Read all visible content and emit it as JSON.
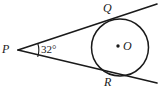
{
  "figure": {
    "type": "geometry-diagram",
    "background_color": "#ffffff",
    "stroke_color": "#1a1a1a",
    "labels": {
      "external_point": "P",
      "upper_tangent_point": "Q",
      "lower_tangent_point": "R",
      "center": "O",
      "angle": "32°"
    },
    "geometry": {
      "circle": {
        "cx": 120,
        "cy": 47.5,
        "r": 28.5
      },
      "center_dot": {
        "cx": 118,
        "cy": 46,
        "r": 1.6
      },
      "external_point": {
        "x": 18,
        "y": 50
      },
      "tangent_point_Q": {
        "x": 112,
        "y": 17.5
      },
      "tangent_point_R": {
        "x": 112,
        "y": 76
      },
      "upper_line": {
        "x1": 18,
        "y1": 50,
        "x2": 157,
        "y2": 4
      },
      "lower_line": {
        "x1": 18,
        "y1": 50,
        "x2": 157,
        "y2": 83
      },
      "angle_arc": {
        "cx": 18,
        "cy": 50,
        "r": 21,
        "start_deg": -18,
        "end_deg": 16
      }
    }
  }
}
